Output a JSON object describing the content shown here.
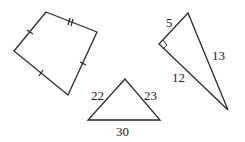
{
  "figures": {
    "quadrilateral": {
      "description": "Kite-like quadrilateral with tick marks indicating congruent sides",
      "vertices": [
        [
          46,
          12
        ],
        [
          97,
          32
        ],
        [
          68,
          95
        ],
        [
          14,
          51
        ]
      ],
      "ticks": [
        {
          "side": "top",
          "count": 2
        },
        {
          "side": "right",
          "count": 1
        },
        {
          "side": "bottom-left",
          "count": 1
        },
        {
          "side": "top-left",
          "count": 1
        }
      ]
    },
    "bottom_triangle": {
      "labels": {
        "left": "22",
        "right": "23",
        "base": "30"
      }
    },
    "right_triangle": {
      "labels": {
        "short_leg": "5",
        "long_leg": "12",
        "hypotenuse": "13"
      },
      "right_angle_marker": true
    }
  },
  "colors": {
    "stroke": "#2a2a2a",
    "background": "#ffffff"
  }
}
